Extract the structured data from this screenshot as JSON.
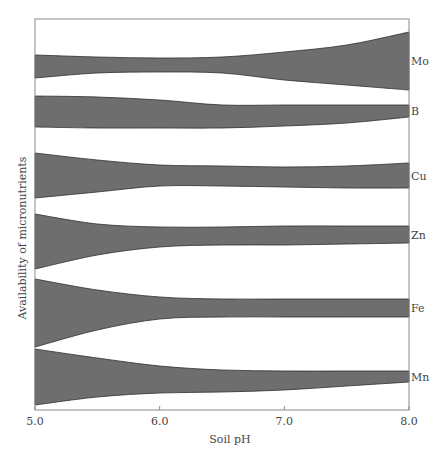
{
  "chart_data": {
    "type": "area",
    "title": "",
    "xlabel": "Soil pH",
    "ylabel": "Availability of micronutrients",
    "xlim": [
      5.0,
      8.0
    ],
    "x_ticks": [
      "5.0",
      "6.0",
      "7.0",
      "8.0"
    ],
    "grid": false,
    "legend_position": "right (inline labels)",
    "fill_color": "#6e6e6e",
    "x": [
      5.0,
      5.5,
      6.0,
      6.5,
      7.0,
      7.5,
      8.0
    ],
    "series": [
      {
        "name": "Mo",
        "top": [
          55,
          57,
          58,
          57,
          52,
          45,
          32
        ],
        "bottom": [
          78,
          73,
          72,
          73,
          80,
          85,
          90
        ]
      },
      {
        "name": "B",
        "top": [
          96,
          97,
          100,
          105,
          105,
          105,
          105
        ],
        "bottom": [
          127,
          128,
          128,
          128,
          126,
          123,
          117
        ]
      },
      {
        "name": "Cu",
        "top": [
          153,
          160,
          165,
          166,
          167,
          166,
          163
        ],
        "bottom": [
          198,
          192,
          186,
          186,
          187,
          188,
          188
        ]
      },
      {
        "name": "Zn",
        "top": [
          214,
          224,
          227,
          227,
          226,
          226,
          226
        ],
        "bottom": [
          269,
          255,
          247,
          245,
          245,
          244,
          243
        ]
      },
      {
        "name": "Fe",
        "top": [
          279,
          290,
          297,
          299,
          299,
          299,
          299
        ],
        "bottom": [
          347,
          330,
          319,
          317,
          317,
          317,
          317
        ]
      },
      {
        "name": "Mn",
        "top": [
          349,
          358,
          366,
          370,
          371,
          371,
          371
        ],
        "bottom": [
          405,
          397,
          393,
          392,
          390,
          386,
          382
        ]
      }
    ]
  },
  "axis": {
    "x_label": "Soil pH",
    "y_label": "Availability of micronutrients"
  }
}
